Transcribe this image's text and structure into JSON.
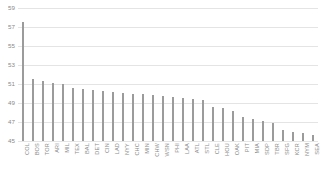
{
  "chart_data": {
    "type": "bar",
    "title": "",
    "subtitle": "",
    "xlabel": "",
    "ylabel": "",
    "ylim": [
      45,
      59
    ],
    "grid": true,
    "legend": "none",
    "orientation": "vertical",
    "bar_color": "#9b9b9b",
    "gridline_color": "#e4e4e4",
    "axis_text_color": "#8a8a8a",
    "ytick_labels": [
      "59",
      "57",
      "55",
      "53",
      "51",
      "49",
      "47",
      "45"
    ],
    "ytick_values": [
      59,
      57,
      55,
      53,
      51,
      49,
      47,
      45
    ],
    "categories": [
      "COL",
      "BOS",
      "TOR",
      "ARI",
      "MIL",
      "TEX",
      "BAL",
      "DET",
      "CIN",
      "LAD",
      "NYY",
      "CHC",
      "MIN",
      "CHW",
      "WSN",
      "PHI",
      "LAA",
      "ATL",
      "STL",
      "CLE",
      "HOU",
      "OAK",
      "PIT",
      "MIA",
      "SDP",
      "TBR",
      "SFG",
      "KCR",
      "NYM",
      "SEA"
    ],
    "values": [
      57.5,
      51.5,
      51.3,
      51.1,
      51.0,
      50.6,
      50.5,
      50.4,
      50.3,
      50.2,
      50.1,
      50.0,
      49.9,
      49.8,
      49.7,
      49.6,
      49.5,
      49.4,
      49.3,
      48.6,
      48.5,
      48.2,
      47.5,
      47.3,
      47.1,
      46.9,
      46.2,
      45.9,
      45.8,
      45.6
    ]
  }
}
